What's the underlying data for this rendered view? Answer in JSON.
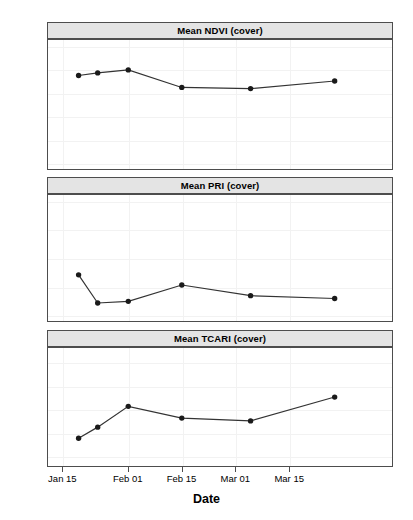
{
  "figure": {
    "xlabel": "Date",
    "x_tick_labels": [
      "Jan 15",
      "Feb 01",
      "Feb 15",
      "Mar 01",
      "Mar 15"
    ],
    "x_tick_days": [
      0,
      17,
      31,
      45,
      59
    ],
    "x_domain_days": [
      -4,
      86
    ],
    "point_color": "#1a1a1a",
    "line_color": "#333333",
    "strip_bg": "#e4e4e4",
    "border_color": "#4d4d4d",
    "grid_color": "#f2f2f2"
  },
  "chart_data": [
    {
      "type": "line",
      "title": "Mean NDVI (cover)",
      "xlabel": "Date",
      "ylabel": "",
      "x": [
        "Jan 19",
        "Jan 24",
        "Feb 01",
        "Feb 15",
        "Mar 05",
        "Mar 27"
      ],
      "x_days": [
        4,
        9,
        17,
        31,
        49,
        71
      ],
      "values": [
        0.876,
        0.887,
        0.9,
        0.824,
        0.819,
        0.852
      ],
      "ylim": [
        0.47,
        1.03
      ],
      "y_ticks": [
        0.5,
        0.6,
        0.7,
        0.8,
        0.9,
        1.0
      ],
      "y_tick_labels": [
        "0.5",
        "0.6",
        "0.7",
        "0.8",
        "0.9",
        "1.0"
      ],
      "grid": true,
      "legend": "none"
    },
    {
      "type": "line",
      "title": "Mean PRI (cover)",
      "xlabel": "Date",
      "ylabel": "",
      "x": [
        "Jan 19",
        "Jan 24",
        "Feb 01",
        "Feb 15",
        "Mar 05",
        "Mar 27"
      ],
      "x_days": [
        4,
        9,
        17,
        31,
        49,
        71
      ],
      "values": [
        -0.13,
        -0.18,
        -0.177,
        -0.148,
        -0.167,
        -0.172
      ],
      "ylim": [
        -0.212,
        0.012
      ],
      "y_ticks": [
        0.0,
        -0.05,
        -0.1,
        -0.15,
        -0.2
      ],
      "y_tick_labels": [
        "0.00",
        "-0.05",
        "-0.10",
        "-0.15",
        "-0.20"
      ],
      "grid": true,
      "legend": "none"
    },
    {
      "type": "line",
      "title": "Mean TCARI (cover)",
      "xlabel": "Date",
      "ylabel": "",
      "x": [
        "Jan 19",
        "Jan 24",
        "Feb 01",
        "Feb 15",
        "Mar 05",
        "Mar 27"
      ],
      "x_days": [
        4,
        9,
        17,
        31,
        49,
        71
      ],
      "values": [
        0.0875,
        0.0923,
        0.1013,
        0.0962,
        0.095,
        0.1053
      ],
      "ylim": [
        0.0755,
        0.1265
      ],
      "y_ticks": [
        0.08,
        0.09,
        0.1,
        0.11,
        0.12
      ],
      "y_tick_labels": [
        "0.08",
        "0.09",
        "0.10",
        "0.11",
        "0.12"
      ],
      "grid": true,
      "legend": "none"
    }
  ]
}
